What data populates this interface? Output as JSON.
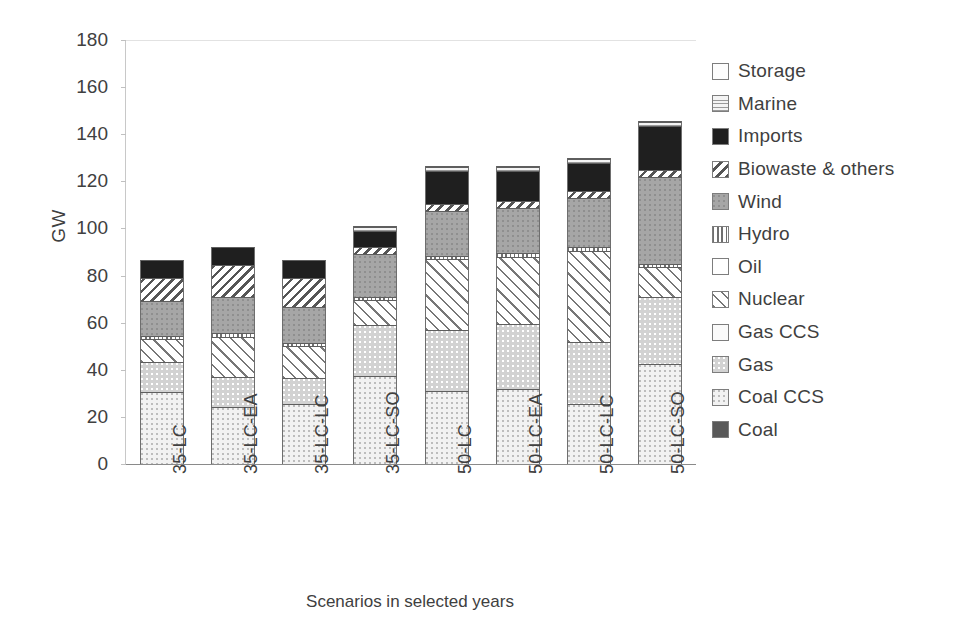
{
  "chart_data": {
    "type": "bar",
    "stacked": true,
    "title": "",
    "xlabel": "Scenarios in selected years",
    "ylabel": "GW",
    "ylim": [
      0,
      180
    ],
    "yticks": [
      180,
      160,
      140,
      120,
      100,
      80,
      60,
      40,
      20,
      0
    ],
    "grid": false,
    "legend_position": "right",
    "categories": [
      "35-LC",
      "35-LC-EA",
      "35-LC-LC",
      "35-LC-SO",
      "50-LC",
      "50-LC-EA",
      "50-LC-LC",
      "50-LC-SO"
    ],
    "series": [
      {
        "name": "Coal",
        "pattern": "solid-dark-gray",
        "color": "#595959",
        "values": [
          0,
          0,
          0,
          0,
          0,
          0,
          0,
          0
        ]
      },
      {
        "name": "Coal CCS",
        "pattern": "fine-speckle-light",
        "color": "#f2f2f2",
        "values": [
          30.5,
          24.0,
          25.5,
          37.5,
          31.0,
          32.0,
          25.5,
          42.5
        ]
      },
      {
        "name": "Gas",
        "pattern": "speckle-gray",
        "color": "#d2d2d2",
        "values": [
          13.0,
          13.0,
          11.0,
          21.5,
          26.0,
          27.5,
          26.5,
          28.5
        ]
      },
      {
        "name": "Gas CCS",
        "pattern": "light-dots",
        "color": "#fafafa",
        "values": [
          0,
          0,
          0,
          0,
          0,
          0,
          0,
          0
        ]
      },
      {
        "name": "Nuclear",
        "pattern": "diagonal-hatch-thin",
        "color": "#ffffff",
        "values": [
          9.5,
          17.0,
          13.5,
          10.5,
          30.0,
          28.5,
          38.5,
          12.5
        ]
      },
      {
        "name": "Oil",
        "pattern": "solid-white",
        "color": "#ffffff",
        "values": [
          0,
          0,
          0,
          0,
          0,
          0,
          0,
          0
        ]
      },
      {
        "name": "Hydro",
        "pattern": "vertical-stripes",
        "color": "#ffffff",
        "values": [
          1.5,
          1.5,
          1.5,
          1.5,
          1.5,
          1.5,
          1.5,
          1.5
        ]
      },
      {
        "name": "Wind",
        "pattern": "speckle-medium-gray",
        "color": "#a6a6a6",
        "values": [
          14.5,
          15.5,
          15.0,
          18.0,
          19.0,
          19.0,
          21.0,
          37.0
        ]
      },
      {
        "name": "Biowaste & others",
        "pattern": "diagonal-hatch-bold",
        "color": "#ffffff",
        "values": [
          10.0,
          13.5,
          12.5,
          3.0,
          3.0,
          3.0,
          3.0,
          3.0
        ]
      },
      {
        "name": "Imports",
        "pattern": "solid-black",
        "color": "#1f1f1f",
        "values": [
          7.5,
          7.5,
          7.5,
          7.0,
          14.0,
          13.0,
          12.0,
          18.5
        ]
      },
      {
        "name": "Marine",
        "pattern": "wavy-speckle",
        "color": "#f4f4f4",
        "values": [
          0,
          0,
          0,
          1.5,
          1.5,
          1.5,
          1.5,
          1.5
        ]
      },
      {
        "name": "Storage",
        "pattern": "solid-white-outline",
        "color": "#fdfdfd",
        "values": [
          0,
          0,
          0,
          0.5,
          0.5,
          0.5,
          0.5,
          0.5
        ]
      }
    ],
    "totals": [
      86.5,
      92.0,
      86.5,
      99.0,
      126.0,
      126.0,
      130.0,
      144.5
    ]
  },
  "legend": {
    "items": [
      {
        "label": "Storage",
        "swatch": "storage-swatch"
      },
      {
        "label": "Marine",
        "swatch": "marine-swatch"
      },
      {
        "label": "Imports",
        "swatch": "imports-swatch"
      },
      {
        "label": "Biowaste & others",
        "swatch": "biowaste-swatch"
      },
      {
        "label": "Wind",
        "swatch": "wind-swatch"
      },
      {
        "label": "Hydro",
        "swatch": "hydro-swatch"
      },
      {
        "label": "Oil",
        "swatch": "oil-swatch"
      },
      {
        "label": "Nuclear",
        "swatch": "nuclear-swatch"
      },
      {
        "label": "Gas CCS",
        "swatch": "gas-ccs-swatch"
      },
      {
        "label": "Gas",
        "swatch": "gas-swatch"
      },
      {
        "label": "Coal CCS",
        "swatch": "coal-ccs-swatch"
      },
      {
        "label": "Coal",
        "swatch": "coal-swatch"
      }
    ]
  }
}
